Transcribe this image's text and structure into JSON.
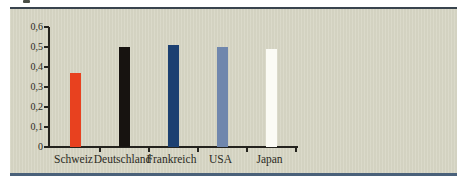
{
  "figure": {
    "panel_background": "#d8d7c6",
    "panel_top_rule_color": "#39444e",
    "panel_bottom_rule_color": "#4a617a",
    "axis_color": "#24231e",
    "text_color": "#2b2a23"
  },
  "chart_data": {
    "type": "bar",
    "title": "",
    "xlabel": "",
    "ylabel": "",
    "categories": [
      "Schweiz",
      "Deutschland",
      "Frankreich",
      "USA",
      "Japan"
    ],
    "values": [
      0.37,
      0.5,
      0.51,
      0.5,
      0.49
    ],
    "bar_colors": [
      "#e8411f",
      "#171310",
      "#1c4071",
      "#7087ad",
      "#fbfbf5"
    ],
    "ylim": [
      0,
      0.6
    ],
    "ytick_labels": [
      "0,6",
      "0,5",
      "0,4",
      "0,3",
      "0,2",
      "0,1",
      "0"
    ],
    "ytick_values": [
      0.6,
      0.5,
      0.4,
      0.3,
      0.2,
      0.1,
      0
    ],
    "decimal_separator": ",",
    "grid": false,
    "legend": "none"
  }
}
